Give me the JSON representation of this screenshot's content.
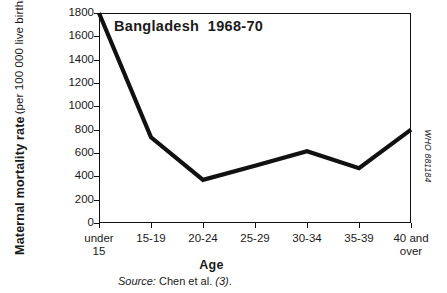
{
  "figure": {
    "title": "Bangladesh  1968-70",
    "x_axis_title": "Age",
    "y_axis_title_main": "Maternal mortality rate",
    "y_axis_title_sub": "(per 100 000 live births)",
    "source_label": "Source:",
    "source_text": "Chen et al.",
    "source_ref": "(3)",
    "source_end": ".",
    "who_code": "WHO 881184",
    "line_color": "#111111",
    "frame_color": "#111111",
    "background_color": "#ffffff"
  },
  "chart_data": {
    "type": "line",
    "title": "Bangladesh  1968-70",
    "xlabel": "Age",
    "ylabel": "Maternal mortality rate (per 100 000 live births)",
    "categories": [
      "under\n15",
      "15-19",
      "20-24",
      "25-29",
      "30-34",
      "35-39",
      "40 and\nover"
    ],
    "category_labels_flat": [
      "under 15",
      "15-19",
      "20-24",
      "25-29",
      "30-34",
      "35-39",
      "40 and over"
    ],
    "values": [
      1800,
      735,
      370,
      490,
      615,
      470,
      800
    ],
    "ylim": [
      0,
      1800
    ],
    "ytick_values": [
      0,
      200,
      400,
      600,
      800,
      1000,
      1200,
      1400,
      1600,
      1800
    ],
    "ytick_labels": [
      "0",
      "200",
      "400",
      "600",
      "800",
      "1000",
      "1200",
      "1400",
      "1600",
      "1800"
    ],
    "grid": false,
    "legend": false,
    "series": [
      {
        "name": "Maternal mortality rate",
        "values": [
          1800,
          735,
          370,
          490,
          615,
          470,
          800
        ],
        "color": "#111111"
      }
    ]
  }
}
